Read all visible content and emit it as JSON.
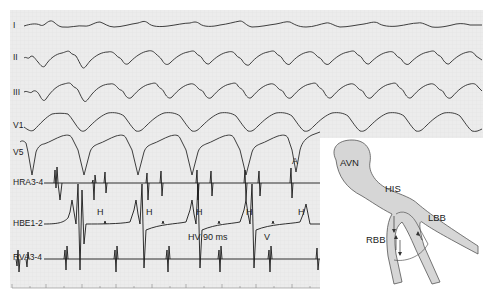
{
  "figure": {
    "colors": {
      "grid_background": "#ececec",
      "grid_line": "#dcdcdc",
      "trace": "#2a2a2a",
      "conduction_fill": "#d6d6d6",
      "conduction_stroke": "#555555"
    },
    "surface_leads": [
      {
        "label": "I"
      },
      {
        "label": "II"
      },
      {
        "label": "III"
      },
      {
        "label": "V1"
      },
      {
        "label": "V5"
      }
    ],
    "intracardiac_leads": [
      {
        "label": "HRA3-4"
      },
      {
        "label": "HBE1-2"
      },
      {
        "label": "RVA3-4"
      }
    ],
    "annotations": {
      "atrial": "A",
      "his": "H",
      "ventricular": "V",
      "hv_interval": "HV 90 ms"
    },
    "diagram": {
      "labels": {
        "avn": "AVN",
        "his": "HIS",
        "lbb": "LBB",
        "rbb": "RBB"
      }
    }
  }
}
